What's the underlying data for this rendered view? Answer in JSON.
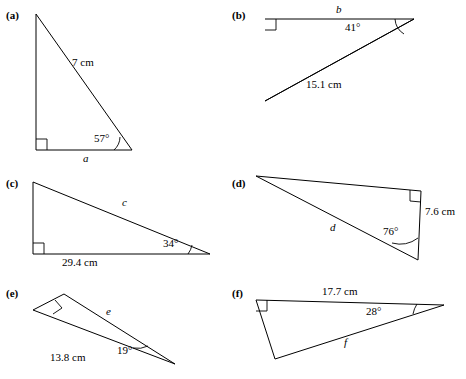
{
  "figures": [
    {
      "tag": "(a)",
      "labels": [
        {
          "text": "7 cm",
          "italic": false
        },
        {
          "text": "57°",
          "italic": false
        },
        {
          "text": "a",
          "italic": true
        }
      ]
    },
    {
      "tag": "(b)",
      "labels": [
        {
          "text": "b",
          "italic": true
        },
        {
          "text": "41°",
          "italic": false
        },
        {
          "text": "15.1 cm",
          "italic": false
        }
      ]
    },
    {
      "tag": "(c)",
      "labels": [
        {
          "text": "c",
          "italic": true
        },
        {
          "text": "34°",
          "italic": false
        },
        {
          "text": "29.4 cm",
          "italic": false
        }
      ]
    },
    {
      "tag": "(d)",
      "labels": [
        {
          "text": "d",
          "italic": true
        },
        {
          "text": "76°",
          "italic": false
        },
        {
          "text": "7.6 cm",
          "italic": false
        }
      ]
    },
    {
      "tag": "(e)",
      "labels": [
        {
          "text": "e",
          "italic": true
        },
        {
          "text": "19°",
          "italic": false
        },
        {
          "text": "13.8 cm",
          "italic": false
        }
      ]
    },
    {
      "tag": "(f)",
      "labels": [
        {
          "text": "17.7 cm",
          "italic": false
        },
        {
          "text": "28°",
          "italic": false
        },
        {
          "text": "f",
          "italic": true
        }
      ]
    }
  ]
}
